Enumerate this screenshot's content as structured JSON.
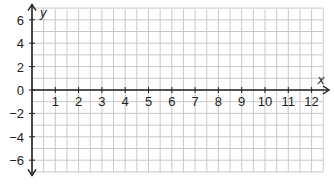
{
  "chart_data": {
    "type": "line",
    "title": "",
    "xlabel": "x",
    "ylabel": "y",
    "xlim": [
      0,
      12.5
    ],
    "ylim": [
      -7,
      7
    ],
    "grid": true,
    "grid_minor_x_step": 0.5,
    "grid_minor_y_step": 1,
    "x_ticks": [
      1,
      2,
      3,
      4,
      5,
      6,
      7,
      8,
      9,
      10,
      11,
      12
    ],
    "x_tick_labels": [
      "1",
      "2",
      "3",
      "4",
      "5",
      "6",
      "7",
      "8",
      "9",
      "10",
      "11",
      "12"
    ],
    "y_ticks": [
      6,
      4,
      2,
      0,
      -2,
      -4,
      -6
    ],
    "y_tick_labels": [
      "6",
      "4",
      "2",
      "0",
      "−2",
      "−4",
      "−6"
    ],
    "series": []
  },
  "colors": {
    "grid": "#c8c8c8",
    "axis": "#222222",
    "text": "#222222"
  }
}
